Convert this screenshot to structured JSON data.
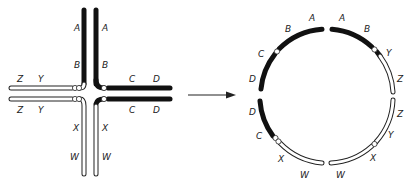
{
  "figure": {
    "type": "chromosome-translocation-diagram",
    "colors": {
      "black_segment": "#111111",
      "white_segment": "#ffffff",
      "outline": "#222222",
      "background": "#ffffff"
    },
    "left_panel": {
      "description": "Cross-shaped pairing configuration of reciprocal translocation heterozygote",
      "labels": {
        "arm_up_left": [
          "A",
          "B"
        ],
        "arm_up_right": [
          "A",
          "B"
        ],
        "arm_right_top": [
          "C",
          "D"
        ],
        "arm_right_bottom": [
          "C",
          "D"
        ],
        "arm_left_top": [
          "Z",
          "Y"
        ],
        "arm_left_bottom": [
          "Z",
          "Y"
        ],
        "arm_down_left": [
          "X",
          "W"
        ],
        "arm_down_right": [
          "X",
          "W"
        ]
      }
    },
    "arrow": {
      "direction": "right"
    },
    "right_panel": {
      "description": "Ring configuration",
      "labels_clockwise_from_top": [
        "A",
        "B",
        "Y",
        "Z",
        "Z",
        "Y",
        "X",
        "W",
        "W",
        "X",
        "C",
        "D",
        "D",
        "C",
        "B",
        "A"
      ]
    }
  }
}
